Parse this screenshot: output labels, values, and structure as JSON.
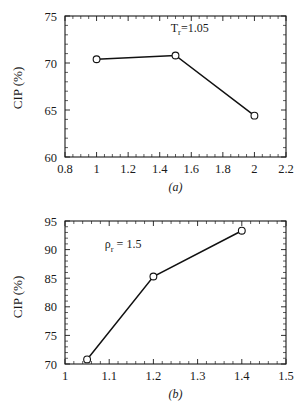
{
  "figure": {
    "background": "#ffffff",
    "ink_color": "#111111"
  },
  "chart_data": [
    {
      "type": "line",
      "panel": "(a)",
      "title": "",
      "xlabel": "",
      "ylabel": "CIP (%)",
      "xlim": [
        0.8,
        2.2
      ],
      "ylim": [
        60,
        75
      ],
      "xticks": [
        0.8,
        1.0,
        1.2,
        1.4,
        1.6,
        1.8,
        2.0,
        2.2
      ],
      "xtick_labels": [
        "0.8",
        "1",
        "1.2",
        "1.4",
        "1.6",
        "1.8",
        "2",
        "2.2"
      ],
      "yticks": [
        60,
        65,
        70,
        75
      ],
      "ytick_labels": [
        "60",
        "65",
        "70",
        "75"
      ],
      "x_minor_per_interval": 4,
      "y_minor_per_interval": 5,
      "grid": false,
      "legend": "none",
      "marker": "open-circle",
      "annotation": {
        "base": "T",
        "sub": "r",
        "tail": "=1.05",
        "x": 1.47,
        "y": 73.3
      },
      "x": [
        1.0,
        1.5,
        2.0
      ],
      "values": [
        70.4,
        70.8,
        64.4
      ]
    },
    {
      "type": "line",
      "panel": "(b)",
      "title": "",
      "xlabel": "",
      "ylabel": "CIP (%)",
      "xlim": [
        1.0,
        1.5
      ],
      "ylim": [
        70,
        95
      ],
      "xticks": [
        1.0,
        1.1,
        1.2,
        1.3,
        1.4,
        1.5
      ],
      "xtick_labels": [
        "1",
        "1.1",
        "1.2",
        "1.3",
        "1.4",
        "1.5"
      ],
      "yticks": [
        70,
        75,
        80,
        85,
        90,
        95
      ],
      "ytick_labels": [
        "70",
        "75",
        "80",
        "85",
        "90",
        "95"
      ],
      "x_minor_per_interval": 5,
      "y_minor_per_interval": 5,
      "grid": false,
      "legend": "none",
      "marker": "open-circle",
      "annotation": {
        "base": "ρ",
        "sub": "r",
        "tail": " = 1.5",
        "x": 1.09,
        "y": 90.2
      },
      "x": [
        1.05,
        1.2,
        1.4
      ],
      "values": [
        70.8,
        85.3,
        93.3
      ]
    }
  ]
}
